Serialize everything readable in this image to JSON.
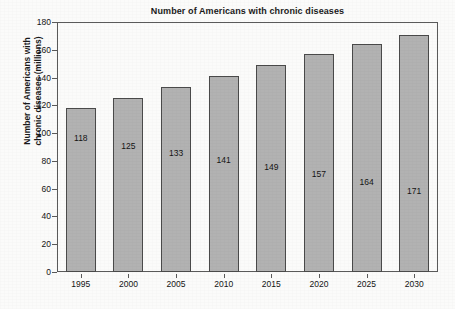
{
  "chart_data": {
    "type": "bar",
    "title": "Number of Americans with chronic diseases",
    "xlabel": "",
    "ylabel_line1": "Number of Americans with",
    "ylabel_line2": "chronic diseases (millions)",
    "categories": [
      "1995",
      "2000",
      "2005",
      "2010",
      "2015",
      "2020",
      "2025",
      "2030"
    ],
    "values": [
      118,
      125,
      133,
      141,
      149,
      157,
      164,
      171
    ],
    "value_labels": [
      "118",
      "125",
      "133",
      "141",
      "149",
      "157",
      "164",
      "171"
    ],
    "ylim": [
      0,
      180
    ],
    "ytick_labels": [
      "0",
      "20",
      "40",
      "60",
      "80",
      "100",
      "120",
      "140",
      "160",
      "180"
    ],
    "ytick_values": [
      0,
      20,
      40,
      60,
      80,
      100,
      120,
      140,
      160,
      180
    ],
    "grid": false,
    "legend": "none",
    "colors": {
      "bar_fill": "#b2b2b2",
      "bar_edge": "#4a4a4a",
      "axis": "#5a5a5a",
      "text": "#141414",
      "background": "#fbfbfa"
    }
  }
}
